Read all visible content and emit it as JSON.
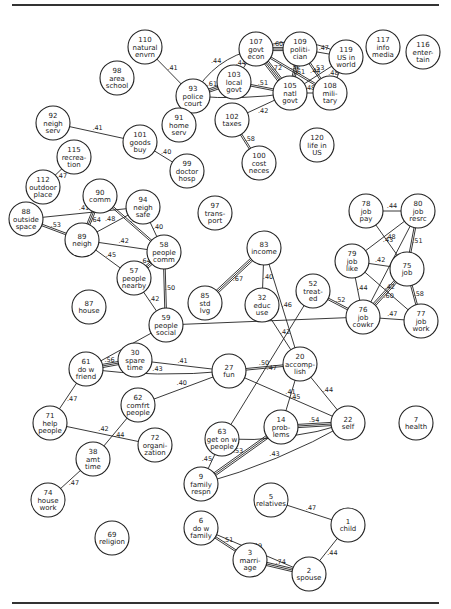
{
  "diagram": {
    "title": "",
    "nodes": [
      {
        "id": "110",
        "lines": [
          "110",
          "natural",
          "envrn"
        ],
        "x": 145,
        "y": 47
      },
      {
        "id": "98",
        "lines": [
          "98",
          "area",
          "school"
        ],
        "x": 117,
        "y": 78
      },
      {
        "id": "93",
        "lines": [
          "93",
          "police",
          "court"
        ],
        "x": 193,
        "y": 96
      },
      {
        "id": "107",
        "lines": [
          "107",
          "govt",
          "econ"
        ],
        "x": 256,
        "y": 49
      },
      {
        "id": "109",
        "lines": [
          "109",
          "politi-",
          "cian"
        ],
        "x": 300,
        "y": 49
      },
      {
        "id": "119",
        "lines": [
          "119",
          "US in",
          "world"
        ],
        "x": 346,
        "y": 57
      },
      {
        "id": "117",
        "lines": [
          "117",
          "info",
          "media"
        ],
        "x": 383,
        "y": 47
      },
      {
        "id": "116",
        "lines": [
          "116",
          "enter-",
          "tain"
        ],
        "x": 423,
        "y": 52
      },
      {
        "id": "103",
        "lines": [
          "103",
          "local",
          "govt"
        ],
        "x": 234,
        "y": 82
      },
      {
        "id": "105",
        "lines": [
          "105",
          "natl",
          "govt"
        ],
        "x": 290,
        "y": 93
      },
      {
        "id": "108",
        "lines": [
          "108",
          "mili-",
          "tary"
        ],
        "x": 330,
        "y": 93
      },
      {
        "id": "91",
        "lines": [
          "91",
          "home",
          "serv"
        ],
        "x": 179,
        "y": 125
      },
      {
        "id": "102",
        "lines": [
          "102",
          "taxes"
        ],
        "x": 232,
        "y": 120
      },
      {
        "id": "100",
        "lines": [
          "100",
          "cost",
          "neces"
        ],
        "x": 259,
        "y": 163
      },
      {
        "id": "120",
        "lines": [
          "120",
          "life in",
          "US"
        ],
        "x": 317,
        "y": 145
      },
      {
        "id": "92",
        "lines": [
          "92",
          "neigh",
          "serv"
        ],
        "x": 53,
        "y": 123
      },
      {
        "id": "101",
        "lines": [
          "101",
          "goods",
          "buy"
        ],
        "x": 140,
        "y": 142
      },
      {
        "id": "99",
        "lines": [
          "99",
          "doctor",
          "hosp"
        ],
        "x": 187,
        "y": 171
      },
      {
        "id": "115",
        "lines": [
          "115",
          "recrea-",
          "tion"
        ],
        "x": 74,
        "y": 157
      },
      {
        "id": "112",
        "lines": [
          "112",
          "outdoor",
          "place"
        ],
        "x": 43,
        "y": 187
      },
      {
        "id": "90",
        "lines": [
          "90",
          "comm"
        ],
        "x": 100,
        "y": 196
      },
      {
        "id": "94",
        "lines": [
          "94",
          "neigh",
          "safe"
        ],
        "x": 143,
        "y": 207
      },
      {
        "id": "88",
        "lines": [
          "88",
          "outside",
          "space"
        ],
        "x": 26,
        "y": 219
      },
      {
        "id": "89",
        "lines": [
          "89",
          "neigh"
        ],
        "x": 82,
        "y": 240
      },
      {
        "id": "58",
        "lines": [
          "58",
          "people",
          "comm"
        ],
        "x": 164,
        "y": 252
      },
      {
        "id": "57",
        "lines": [
          "57",
          "people",
          "nearby"
        ],
        "x": 134,
        "y": 278
      },
      {
        "id": "87",
        "lines": [
          "87",
          "house"
        ],
        "x": 89,
        "y": 307
      },
      {
        "id": "97",
        "lines": [
          "97",
          "trans-",
          "port"
        ],
        "x": 215,
        "y": 213
      },
      {
        "id": "83",
        "lines": [
          "83",
          "income"
        ],
        "x": 264,
        "y": 248
      },
      {
        "id": "85",
        "lines": [
          "85",
          "std",
          "lvg"
        ],
        "x": 205,
        "y": 303
      },
      {
        "id": "32",
        "lines": [
          "32",
          "educ",
          "use"
        ],
        "x": 262,
        "y": 305
      },
      {
        "id": "52",
        "lines": [
          "52",
          "treat-",
          "ed"
        ],
        "x": 313,
        "y": 291
      },
      {
        "id": "78",
        "lines": [
          "78",
          "job",
          "pay"
        ],
        "x": 366,
        "y": 211
      },
      {
        "id": "80",
        "lines": [
          "80",
          "job",
          "resrc"
        ],
        "x": 418,
        "y": 211
      },
      {
        "id": "79",
        "lines": [
          "79",
          "job",
          "like"
        ],
        "x": 352,
        "y": 261
      },
      {
        "id": "75",
        "lines": [
          "75",
          "job"
        ],
        "x": 407,
        "y": 269
      },
      {
        "id": "76",
        "lines": [
          "76",
          "job",
          "cowkr"
        ],
        "x": 363,
        "y": 317
      },
      {
        "id": "77",
        "lines": [
          "77",
          "job",
          "work"
        ],
        "x": 421,
        "y": 321
      },
      {
        "id": "59",
        "lines": [
          "59",
          "people",
          "social"
        ],
        "x": 166,
        "y": 325
      },
      {
        "id": "61",
        "lines": [
          "61",
          "do w",
          "friend"
        ],
        "x": 86,
        "y": 369
      },
      {
        "id": "30",
        "lines": [
          "30",
          "spare",
          "time"
        ],
        "x": 135,
        "y": 360
      },
      {
        "id": "27",
        "lines": [
          "27",
          "fun"
        ],
        "x": 229,
        "y": 371
      },
      {
        "id": "20",
        "lines": [
          "20",
          "accomp-",
          "lish"
        ],
        "x": 300,
        "y": 364
      },
      {
        "id": "62",
        "lines": [
          "62",
          "comfrt",
          "people"
        ],
        "x": 138,
        "y": 405
      },
      {
        "id": "71",
        "lines": [
          "71",
          "help",
          "people"
        ],
        "x": 50,
        "y": 423
      },
      {
        "id": "72",
        "lines": [
          "72",
          "organi-",
          "zation"
        ],
        "x": 155,
        "y": 445
      },
      {
        "id": "38",
        "lines": [
          "38",
          "amt",
          "time"
        ],
        "x": 93,
        "y": 459
      },
      {
        "id": "74",
        "lines": [
          "74",
          "house",
          "work"
        ],
        "x": 48,
        "y": 500
      },
      {
        "id": "63",
        "lines": [
          "63",
          "get on w",
          "people"
        ],
        "x": 222,
        "y": 439
      },
      {
        "id": "14",
        "lines": [
          "14",
          "prob-",
          "lems"
        ],
        "x": 281,
        "y": 427
      },
      {
        "id": "22",
        "lines": [
          "22",
          "self"
        ],
        "x": 348,
        "y": 423
      },
      {
        "id": "7",
        "lines": [
          "7",
          "health"
        ],
        "x": 416,
        "y": 423
      },
      {
        "id": "9",
        "lines": [
          "9",
          "family",
          "respn"
        ],
        "x": 201,
        "y": 484
      },
      {
        "id": "69",
        "lines": [
          "69",
          "religion"
        ],
        "x": 112,
        "y": 538
      },
      {
        "id": "5",
        "lines": [
          "5",
          "relatives"
        ],
        "x": 271,
        "y": 500
      },
      {
        "id": "1",
        "lines": [
          "1",
          "child"
        ],
        "x": 348,
        "y": 525
      },
      {
        "id": "6",
        "lines": [
          "6",
          "do w",
          "family"
        ],
        "x": 201,
        "y": 528
      },
      {
        "id": "3",
        "lines": [
          "3",
          "marri-",
          "age"
        ],
        "x": 250,
        "y": 560
      },
      {
        "id": "2",
        "lines": [
          "2",
          "spouse"
        ],
        "x": 309,
        "y": 574
      }
    ],
    "edges": [
      {
        "from": "110",
        "to": "93",
        "label": ".41",
        "weight": 1
      },
      {
        "from": "93",
        "to": "107",
        "label": ".44",
        "weight": 1,
        "curve": -18
      },
      {
        "from": "93",
        "to": "103",
        "label": ".61",
        "weight": 3
      },
      {
        "from": "93",
        "to": "105",
        "label": ".45",
        "weight": 1,
        "curve": 6
      },
      {
        "from": "103",
        "to": "107",
        "label": ".44",
        "weight": 1
      },
      {
        "from": "103",
        "to": "105",
        "label": ".51",
        "weight": 2
      },
      {
        "from": "107",
        "to": "109",
        "label": ".60",
        "weight": 3
      },
      {
        "from": "107",
        "to": "105",
        "label": ".72",
        "weight": 4
      },
      {
        "from": "107",
        "to": "108",
        "label": ".52",
        "weight": 2
      },
      {
        "from": "107",
        "to": "119",
        "label": ".40",
        "weight": 1,
        "curve": -22
      },
      {
        "from": "109",
        "to": "105",
        "label": ".61",
        "weight": 3
      },
      {
        "from": "109",
        "to": "108",
        "label": ".53",
        "weight": 2
      },
      {
        "from": "109",
        "to": "119",
        "label": ".47",
        "weight": 1
      },
      {
        "from": "105",
        "to": "119",
        "label": ".44",
        "weight": 1
      },
      {
        "from": "105",
        "to": "108",
        "label": ".48",
        "weight": 1
      },
      {
        "from": "108",
        "to": "119",
        "label": ".48",
        "weight": 1
      },
      {
        "from": "105",
        "to": "102",
        "label": ".42",
        "weight": 1
      },
      {
        "from": "102",
        "to": "100",
        "label": ".58",
        "weight": 2
      },
      {
        "from": "92",
        "to": "101",
        "label": ".41",
        "weight": 1
      },
      {
        "from": "101",
        "to": "99",
        "label": ".40",
        "weight": 1
      },
      {
        "from": "115",
        "to": "112",
        "label": ".47",
        "weight": 1
      },
      {
        "from": "88",
        "to": "89",
        "label": ".53",
        "weight": 2
      },
      {
        "from": "88",
        "to": "94",
        "label": ".41",
        "weight": 1
      },
      {
        "from": "90",
        "to": "89",
        "label": ".64",
        "weight": 3
      },
      {
        "from": "90",
        "to": "58",
        "label": ".52",
        "weight": 2
      },
      {
        "from": "89",
        "to": "94",
        "label": ".48",
        "weight": 1
      },
      {
        "from": "89",
        "to": "58",
        "label": ".42",
        "weight": 1
      },
      {
        "from": "89",
        "to": "57",
        "label": ".45",
        "weight": 1
      },
      {
        "from": "94",
        "to": "58",
        "label": ".40",
        "weight": 1
      },
      {
        "from": "57",
        "to": "58",
        "label": ".64",
        "weight": 3
      },
      {
        "from": "58",
        "to": "59",
        "label": ".50",
        "weight": 2
      },
      {
        "from": "57",
        "to": "59",
        "label": ".42",
        "weight": 1
      },
      {
        "from": "59",
        "to": "76",
        "label": ".44",
        "weight": 1
      },
      {
        "from": "59",
        "to": "61",
        "label": ".47",
        "weight": 1
      },
      {
        "from": "83",
        "to": "85",
        "label": ".67",
        "weight": 3
      },
      {
        "from": "83",
        "to": "32",
        "label": ".40",
        "weight": 1
      },
      {
        "from": "83",
        "to": "20",
        "label": ".46",
        "weight": 1
      },
      {
        "from": "32",
        "to": "20",
        "label": ".42",
        "weight": 1
      },
      {
        "from": "52",
        "to": "76",
        "label": ".52",
        "weight": 2
      },
      {
        "from": "52",
        "to": "63",
        "label": ".47",
        "weight": 1
      },
      {
        "from": "78",
        "to": "80",
        "label": ".44",
        "weight": 1
      },
      {
        "from": "78",
        "to": "75",
        "label": ".48",
        "weight": 1
      },
      {
        "from": "80",
        "to": "79",
        "label": ".43",
        "weight": 1
      },
      {
        "from": "80",
        "to": "76",
        "label": ".47",
        "weight": 1
      },
      {
        "from": "80",
        "to": "75",
        "label": ".51",
        "weight": 2
      },
      {
        "from": "79",
        "to": "75",
        "label": ".42",
        "weight": 1
      },
      {
        "from": "79",
        "to": "76",
        "label": ".44",
        "weight": 1
      },
      {
        "from": "79",
        "to": "77",
        "label": ".42",
        "weight": 1
      },
      {
        "from": "75",
        "to": "76",
        "label": ".60",
        "weight": 3
      },
      {
        "from": "75",
        "to": "77",
        "label": ".58",
        "weight": 2
      },
      {
        "from": "76",
        "to": "77",
        "label": ".47",
        "weight": 1
      },
      {
        "from": "61",
        "to": "30",
        "label": ".56",
        "weight": 3
      },
      {
        "from": "61",
        "to": "27",
        "label": ".43",
        "weight": 1,
        "curve": 8
      },
      {
        "from": "30",
        "to": "27",
        "label": ".41",
        "weight": 1
      },
      {
        "from": "62",
        "to": "27",
        "label": ".40",
        "weight": 1
      },
      {
        "from": "27",
        "to": "20",
        "label": ".50",
        "weight": 2
      },
      {
        "from": "27",
        "to": "22",
        "label": ".41",
        "weight": 1
      },
      {
        "from": "20",
        "to": "14",
        "label": ".45",
        "weight": 1
      },
      {
        "from": "20",
        "to": "22",
        "label": ".44",
        "weight": 1
      },
      {
        "from": "14",
        "to": "22",
        "label": ".54",
        "weight": 3
      },
      {
        "from": "63",
        "to": "22",
        "label": ".41",
        "weight": 1,
        "curve": 12
      },
      {
        "from": "9",
        "to": "63",
        "label": ".45",
        "weight": 1
      },
      {
        "from": "9",
        "to": "14",
        "label": ".53",
        "weight": 3
      },
      {
        "from": "9",
        "to": "22",
        "label": ".43",
        "weight": 1,
        "curve": 10
      },
      {
        "from": "61",
        "to": "71",
        "label": ".47",
        "weight": 1
      },
      {
        "from": "71",
        "to": "72",
        "label": ".42",
        "weight": 1
      },
      {
        "from": "62",
        "to": "38",
        "label": ".44",
        "weight": 1
      },
      {
        "from": "38",
        "to": "74",
        "label": ".47",
        "weight": 1
      },
      {
        "from": "5",
        "to": "1",
        "label": ".47",
        "weight": 1
      },
      {
        "from": "1",
        "to": "2",
        "label": ".44",
        "weight": 1
      },
      {
        "from": "6",
        "to": "3",
        "label": ".51",
        "weight": 2
      },
      {
        "from": "6",
        "to": "2",
        "label": ".49",
        "weight": 1
      },
      {
        "from": "3",
        "to": "2",
        "label": ".74",
        "weight": 3
      }
    ]
  }
}
